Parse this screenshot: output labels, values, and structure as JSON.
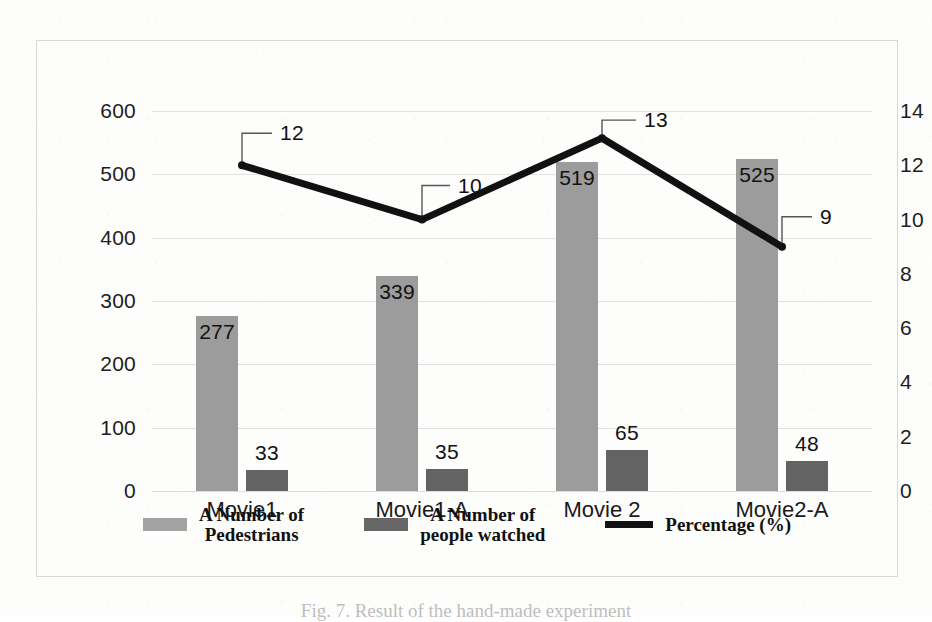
{
  "figure": {
    "caption": "Fig. 7.  Result of the hand-made experiment"
  },
  "axes": {
    "left_ticks": [
      "600",
      "500",
      "400",
      "300",
      "200",
      "100",
      "0"
    ],
    "right_ticks": [
      "14",
      "12",
      "10",
      "8",
      "6",
      "4",
      "2",
      "0"
    ],
    "categories": [
      "Movie1",
      "Movie1-A",
      "Movie 2",
      "Movie2-A"
    ]
  },
  "legend": {
    "items": [
      {
        "label_line1": "A Number of",
        "label_line2": "Pedestrians",
        "swatch": "light-gray-bar",
        "color": "#a2a2a2"
      },
      {
        "label_line1": "A Number of",
        "label_line2": "people watched",
        "swatch": "dark-gray-bar",
        "color": "#666666"
      },
      {
        "label_line1": "Percentage (%)",
        "label_line2": "",
        "swatch": "black-line",
        "color": "#111111"
      }
    ]
  },
  "chart_data": {
    "type": "bar",
    "title": "",
    "xlabel": "",
    "ylabel": "",
    "categories": [
      "Movie1",
      "Movie1-A",
      "Movie 2",
      "Movie2-A"
    ],
    "ylim": [
      0,
      600
    ],
    "y2lim": [
      0,
      14
    ],
    "grid": true,
    "legend_position": "bottom",
    "series": [
      {
        "name": "A Number of Pedestrians",
        "type": "bar",
        "axis": "left",
        "color": "#9c9c9c",
        "values": [
          277,
          339,
          519,
          525
        ],
        "labels": [
          "277",
          "339",
          "519",
          "525"
        ],
        "label_position": "inside-top"
      },
      {
        "name": "A Number of people watched",
        "type": "bar",
        "axis": "left",
        "color": "#636363",
        "values": [
          33,
          35,
          65,
          48
        ],
        "labels": [
          "33",
          "35",
          "65",
          "48"
        ],
        "label_position": "outside-top"
      },
      {
        "name": "Percentage (%)",
        "type": "line",
        "axis": "right",
        "color": "#111111",
        "values": [
          12,
          10,
          13,
          9
        ],
        "labels": [
          "12",
          "10",
          "13",
          "9"
        ],
        "label_position": "callout"
      }
    ]
  }
}
